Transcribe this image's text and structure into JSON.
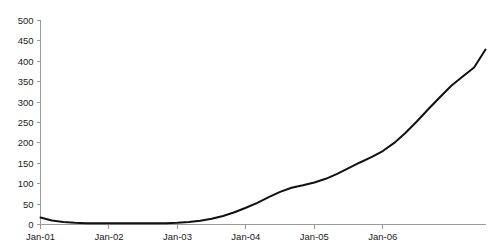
{
  "chart_data": {
    "type": "line",
    "title": "",
    "subtitle": "",
    "xlabel": "",
    "ylabel": "",
    "grid": false,
    "legend": false,
    "legend_position": "none",
    "ylim": [
      0,
      500
    ],
    "ytick_labels": [
      "0",
      "50",
      "100",
      "150",
      "200",
      "250",
      "300",
      "350",
      "400",
      "450",
      "500"
    ],
    "ytick_values": [
      0,
      50,
      100,
      150,
      200,
      250,
      300,
      350,
      400,
      450,
      500
    ],
    "xtick_labels": [
      "Jan-01",
      "Jan-02",
      "Jan-03",
      "Jan-04",
      "Jan-05",
      "Jan-06"
    ],
    "xtick_values": [
      0,
      12,
      24,
      36,
      48,
      60
    ],
    "xlim": [
      0,
      78
    ],
    "series": [
      {
        "name": "series-1",
        "color": "#111111",
        "x": [
          0,
          2,
          4,
          6,
          8,
          10,
          12,
          14,
          16,
          18,
          20,
          22,
          24,
          26,
          28,
          30,
          32,
          34,
          36,
          38,
          40,
          42,
          44,
          46,
          48,
          50,
          52,
          54,
          56,
          58,
          60,
          62,
          64,
          66,
          68,
          70,
          72,
          74,
          76,
          78
        ],
        "values": [
          17,
          10,
          6,
          4,
          3,
          3,
          3,
          3,
          3,
          3,
          3,
          3,
          4,
          6,
          9,
          14,
          21,
          30,
          41,
          53,
          67,
          80,
          90,
          96,
          103,
          112,
          124,
          138,
          152,
          165,
          180,
          200,
          225,
          253,
          283,
          312,
          340,
          363,
          385,
          429
        ]
      }
    ]
  }
}
